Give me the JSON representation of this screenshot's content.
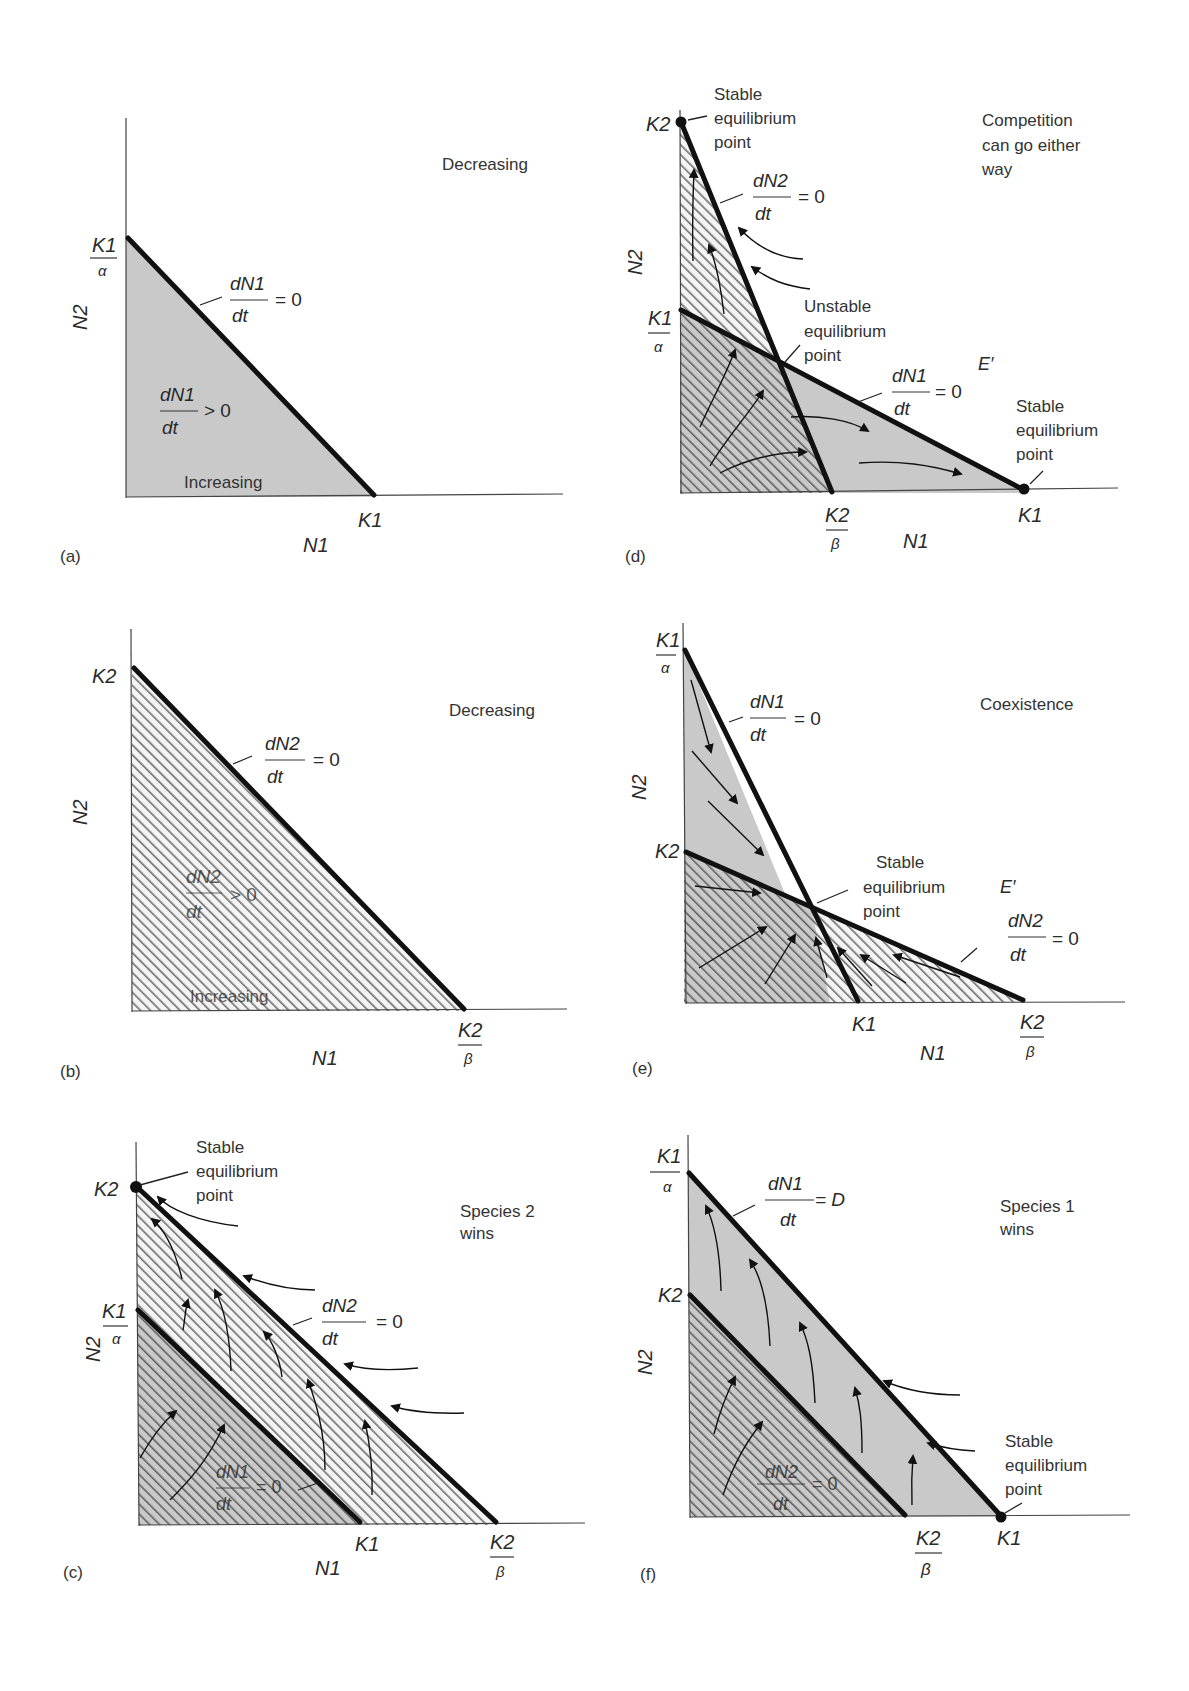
{
  "figure": {
    "colors": {
      "gray_fill": "#c9c9c9",
      "hatch_line": "#6e6e6e",
      "isocline": "#111111",
      "text": "#2a2a2a"
    },
    "panels": [
      {
        "id": "a",
        "label": "(a)",
        "x_axis_label": "N1",
        "y_axis_label": "N2",
        "y_intercept_label": {
          "num": "K1",
          "den": "α"
        },
        "x_intercept_label": "K1",
        "isocline_label": {
          "num": "dN1",
          "den": "dt",
          "rhs": "= 0"
        },
        "region_label": {
          "num": "dN1",
          "den": "dt",
          "rhs": "> 0"
        },
        "region_fill": "gray",
        "inside_text": "Increasing",
        "outside_text": "Decreasing"
      },
      {
        "id": "b",
        "label": "(b)",
        "x_axis_label": "N1",
        "y_axis_label": "N2",
        "y_intercept_label": "K2",
        "x_intercept_label": {
          "num": "K2",
          "den": "β"
        },
        "isocline_label": {
          "num": "dN2",
          "den": "dt",
          "rhs": "= 0"
        },
        "region_label": {
          "num": "dN2",
          "den": "dt",
          "rhs": "> 0"
        },
        "region_fill": "hatched",
        "inside_text": "Increasing",
        "outside_text": "Decreasing"
      },
      {
        "id": "c",
        "label": "(c)",
        "x_axis_label": "N1",
        "y_axis_label": "N2",
        "y_intercepts": [
          "K2",
          {
            "num": "K1",
            "den": "α"
          }
        ],
        "x_intercepts": [
          "K1",
          {
            "num": "K2",
            "den": "β"
          }
        ],
        "isocline_labels": [
          {
            "num": "dN2",
            "den": "dt",
            "rhs": "= 0"
          },
          {
            "num": "dN1",
            "den": "dt",
            "rhs": "= 0"
          }
        ],
        "equilibrium_label": [
          "Stable",
          "equilibrium",
          "point"
        ],
        "outcome": [
          "Species 2",
          "wins"
        ]
      },
      {
        "id": "d",
        "label": "(d)",
        "x_axis_label": "N1",
        "y_axis_label": "N2",
        "y_intercepts": [
          "K2",
          {
            "num": "K1",
            "den": "α"
          }
        ],
        "x_intercepts": [
          {
            "num": "K2",
            "den": "β"
          },
          "K1"
        ],
        "isocline_labels": [
          {
            "num": "dN2",
            "den": "dt",
            "rhs": "= 0"
          },
          {
            "num": "dN1",
            "den": "dt",
            "rhs": "= 0"
          }
        ],
        "stable_top_label": [
          "Stable",
          "equilibrium",
          "point"
        ],
        "unstable_label": [
          "Unstable",
          "equilibrium",
          "point"
        ],
        "stable_right_label": [
          "Stable",
          "equilibrium",
          "point"
        ],
        "e_prime": "E′",
        "outcome": [
          "Competition",
          "can go either",
          "way"
        ]
      },
      {
        "id": "e",
        "label": "(e)",
        "x_axis_label": "N1",
        "y_axis_label": "N2",
        "y_intercepts": [
          {
            "num": "K1",
            "den": "α"
          },
          "K2"
        ],
        "x_intercepts": [
          "K1",
          {
            "num": "K2",
            "den": "β"
          }
        ],
        "isocline_labels": [
          {
            "num": "dN1",
            "den": "dt",
            "rhs": "= 0"
          },
          {
            "num": "dN2",
            "den": "dt",
            "rhs": "= 0"
          }
        ],
        "stable_label": [
          "Stable",
          "equilibrium",
          "point"
        ],
        "e_prime": "E′",
        "outcome": [
          "Coexistence"
        ]
      },
      {
        "id": "f",
        "label": "(f)",
        "x_axis_label": "N1",
        "y_axis_label": "N2",
        "y_intercepts": [
          {
            "num": "K1",
            "den": "α"
          },
          "K2"
        ],
        "x_intercepts": [
          {
            "num": "K2",
            "den": "β"
          },
          "K1"
        ],
        "isocline_labels": [
          {
            "num": "dN1",
            "den": "dt",
            "rhs": "= D"
          },
          {
            "num": "dN2",
            "den": "dt",
            "rhs": "= 0"
          }
        ],
        "stable_label": [
          "Stable",
          "equilibrium",
          "point"
        ],
        "outcome": [
          "Species 1",
          "wins"
        ]
      }
    ]
  }
}
